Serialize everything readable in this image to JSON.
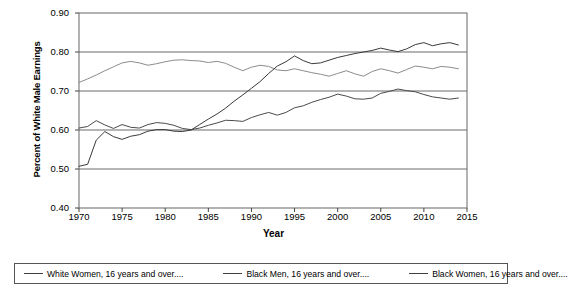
{
  "chart_data": {
    "type": "line",
    "title": "",
    "xlabel": "Year",
    "ylabel": "Percent of White Male Earnings",
    "xlim": [
      1970,
      2015
    ],
    "ylim": [
      0.4,
      0.9
    ],
    "grid": true,
    "legend_position": "bottom",
    "x_ticks": [
      "1970",
      "1975",
      "1980",
      "1985",
      "1990",
      "1995",
      "2000",
      "2005",
      "2010",
      "2015"
    ],
    "y_ticks": [
      "0.40",
      "0.50",
      "0.60",
      "0.70",
      "0.80",
      "0.90"
    ],
    "x": [
      1970,
      1971,
      1972,
      1973,
      1974,
      1975,
      1976,
      1977,
      1978,
      1979,
      1980,
      1981,
      1982,
      1983,
      1984,
      1985,
      1986,
      1987,
      1988,
      1989,
      1990,
      1991,
      1992,
      1993,
      1994,
      1995,
      1996,
      1997,
      1998,
      1999,
      2000,
      2001,
      2002,
      2003,
      2004,
      2005,
      2006,
      2007,
      2008,
      2009,
      2010,
      2011,
      2012,
      2013,
      2014
    ],
    "series": [
      {
        "name": "White Women, 16 years and over....",
        "color": "#8c8c8c",
        "values": [
          0.722,
          0.731,
          0.741,
          0.752,
          0.762,
          0.772,
          0.776,
          0.772,
          0.766,
          0.77,
          0.775,
          0.779,
          0.78,
          0.778,
          0.777,
          0.773,
          0.776,
          0.771,
          0.761,
          0.752,
          0.761,
          0.766,
          0.763,
          0.754,
          0.752,
          0.757,
          0.752,
          0.747,
          0.743,
          0.738,
          0.745,
          0.752,
          0.744,
          0.738,
          0.75,
          0.757,
          0.752,
          0.746,
          0.755,
          0.764,
          0.761,
          0.757,
          0.763,
          0.761,
          0.757
        ]
      },
      {
        "name": "Black Men, 16 years and over....",
        "color": "#4a4a4a",
        "values": [
          0.605,
          0.609,
          0.624,
          0.613,
          0.604,
          0.614,
          0.607,
          0.605,
          0.614,
          0.619,
          0.617,
          0.612,
          0.604,
          0.601,
          0.605,
          0.612,
          0.618,
          0.625,
          0.624,
          0.622,
          0.632,
          0.639,
          0.645,
          0.638,
          0.645,
          0.657,
          0.662,
          0.671,
          0.678,
          0.684,
          0.692,
          0.687,
          0.68,
          0.679,
          0.682,
          0.694,
          0.699,
          0.705,
          0.701,
          0.698,
          0.691,
          0.685,
          0.682,
          0.679,
          0.682
        ]
      },
      {
        "name": "Black Women, 16 years and over....",
        "color": "#3a3a3a",
        "values": [
          0.507,
          0.512,
          0.574,
          0.596,
          0.583,
          0.576,
          0.584,
          0.588,
          0.597,
          0.601,
          0.601,
          0.597,
          0.596,
          0.6,
          0.614,
          0.628,
          0.641,
          0.656,
          0.674,
          0.69,
          0.707,
          0.724,
          0.745,
          0.764,
          0.775,
          0.79,
          0.778,
          0.77,
          0.772,
          0.779,
          0.786,
          0.791,
          0.796,
          0.8,
          0.804,
          0.81,
          0.805,
          0.801,
          0.808,
          0.819,
          0.824,
          0.816,
          0.821,
          0.824,
          0.818
        ]
      }
    ]
  },
  "legend": {
    "entries": [
      {
        "label": "White Women, 16 years and over...."
      },
      {
        "label": "Black Men, 16 years and over...."
      },
      {
        "label": "Black Women, 16 years and over...."
      }
    ]
  }
}
